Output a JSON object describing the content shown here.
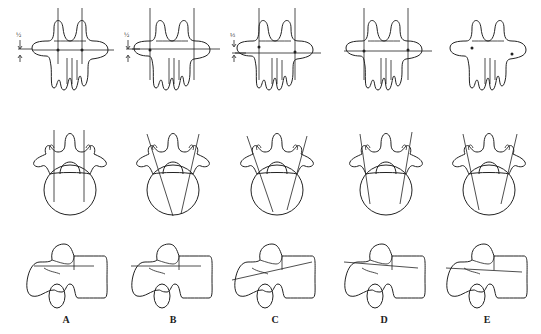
{
  "figure": {
    "type": "anatomical-diagram",
    "views": [
      "posterior",
      "axial",
      "lateral"
    ],
    "stroke_color": "#222222",
    "background": "#ffffff",
    "panels": [
      {
        "id": "A",
        "label": "A",
        "fraction": "½",
        "posterior_lines": "vertical-parallel",
        "axial_lines": "parallel",
        "lateral_line": "horizontal"
      },
      {
        "id": "B",
        "label": "B",
        "fraction": "½",
        "posterior_lines": "vertical-parallel",
        "axial_lines": "convergent",
        "lateral_line": "horizontal"
      },
      {
        "id": "C",
        "label": "C",
        "fraction": "⅓",
        "posterior_lines": "vertical-parallel",
        "axial_lines": "convergent-steep",
        "lateral_line": "ascending"
      },
      {
        "id": "D",
        "label": "D",
        "fraction": "",
        "posterior_lines": "vertical-parallel",
        "axial_lines": "convergent",
        "lateral_line": "slightly-descending"
      },
      {
        "id": "E",
        "label": "E",
        "fraction": "",
        "posterior_lines": "none",
        "axial_lines": "convergent",
        "lateral_line": "slightly-descending"
      }
    ]
  }
}
